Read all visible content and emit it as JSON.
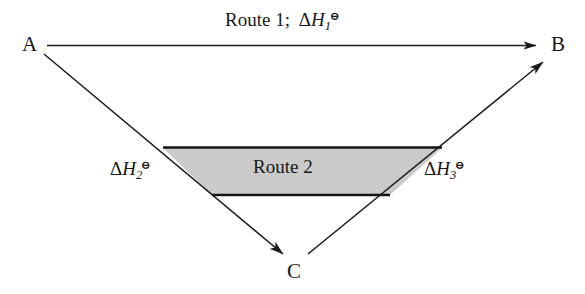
{
  "diagram": {
    "type": "hess-law-energy-cycle",
    "title_visible": false,
    "background_color": "#ffffff",
    "line_color": "#1a1a1a",
    "fill_color": "#cacaca",
    "vertices": [
      {
        "id": "A",
        "label": "A",
        "x": 30,
        "y": 45
      },
      {
        "id": "B",
        "label": "B",
        "x": 557,
        "y": 45
      },
      {
        "id": "C",
        "label": "C",
        "x": 295,
        "y": 270
      }
    ],
    "arrows": [
      {
        "id": "A-to-B",
        "from": "A",
        "to": "B",
        "label": "Route 1;  ΔH₁⊖",
        "style": "straight-horizontal"
      },
      {
        "id": "A-to-C",
        "from": "A",
        "to": "C",
        "label": "ΔH₂⊖",
        "style": "diagonal-down-right"
      },
      {
        "id": "C-to-B",
        "from": "C",
        "to": "B",
        "label": "ΔH₃⊖",
        "style": "diagonal-up-right"
      }
    ],
    "labels": {
      "vertex_a": "A",
      "vertex_b": "B",
      "vertex_c": "C",
      "route1_prefix": "Route 1;",
      "route2": "Route 2",
      "delta_symbol": "Δ",
      "h_symbol": "H",
      "standard_state_symbol": "⊖",
      "enthalpy_1_subscript": "1",
      "enthalpy_2_subscript": "2",
      "enthalpy_3_subscript": "3"
    },
    "shaded_band": {
      "name": "route-2-band",
      "fill": "#cacaca",
      "stroke": "#1a1a1a",
      "caption": "Route 2",
      "top_left": [
        163,
        148
      ],
      "top_right": [
        442,
        148
      ],
      "bottom_right": [
        390,
        195
      ],
      "bottom_left": [
        212,
        195
      ]
    }
  }
}
